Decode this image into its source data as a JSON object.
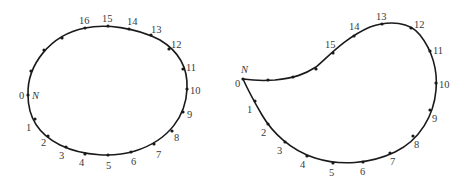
{
  "figure": {
    "left_shape": {
      "name": "ellipse",
      "start_label": "N",
      "points": [
        {
          "label": "0",
          "x": 28,
          "y": 95,
          "lx": 19,
          "ly": 99
        },
        {
          "label": "1",
          "x": 35,
          "y": 119,
          "lx": 26,
          "ly": 131
        },
        {
          "label": "2",
          "x": 48,
          "y": 136,
          "lx": 41,
          "ly": 146
        },
        {
          "label": "3",
          "x": 66,
          "y": 147,
          "lx": 59,
          "ly": 159
        },
        {
          "label": "4",
          "x": 85,
          "y": 154,
          "lx": 79,
          "ly": 166
        },
        {
          "label": "5",
          "x": 108,
          "y": 155,
          "lx": 106,
          "ly": 169
        },
        {
          "label": "6",
          "x": 131,
          "y": 152,
          "lx": 131,
          "ly": 165
        },
        {
          "label": "7",
          "x": 154,
          "y": 144,
          "lx": 156,
          "ly": 158
        },
        {
          "label": "8",
          "x": 172,
          "y": 131,
          "lx": 174,
          "ly": 141
        },
        {
          "label": "9",
          "x": 183,
          "y": 112,
          "lx": 187,
          "ly": 118
        },
        {
          "label": "10",
          "x": 187,
          "y": 89,
          "lx": 190,
          "ly": 94
        },
        {
          "label": "11",
          "x": 183,
          "y": 69,
          "lx": 186,
          "ly": 71
        },
        {
          "label": "12",
          "x": 169,
          "y": 49,
          "lx": 171,
          "ly": 48
        },
        {
          "label": "13",
          "x": 151,
          "y": 35,
          "lx": 151,
          "ly": 33
        },
        {
          "label": "14",
          "x": 129,
          "y": 29,
          "lx": 127,
          "ly": 25
        },
        {
          "label": "15",
          "x": 108,
          "y": 26,
          "lx": 102,
          "ly": 22
        },
        {
          "label": "16",
          "x": 85,
          "y": 28,
          "lx": 79,
          "ly": 24
        }
      ],
      "extra_points": [
        {
          "x": 62,
          "y": 38
        },
        {
          "x": 44,
          "y": 50
        },
        {
          "x": 31,
          "y": 71
        }
      ]
    },
    "right_shape": {
      "name": "cam-profile",
      "start_label": "N",
      "points": [
        {
          "label": "0",
          "x": 243,
          "y": 79,
          "lx": 235,
          "ly": 87
        },
        {
          "label": "1",
          "x": 255,
          "y": 101,
          "lx": 247,
          "ly": 113
        },
        {
          "label": "2",
          "x": 268,
          "y": 124,
          "lx": 261,
          "ly": 136
        },
        {
          "label": "3",
          "x": 285,
          "y": 142,
          "lx": 277,
          "ly": 154
        },
        {
          "label": "4",
          "x": 307,
          "y": 156,
          "lx": 300,
          "ly": 168
        },
        {
          "label": "5",
          "x": 333,
          "y": 163,
          "lx": 329,
          "ly": 176
        },
        {
          "label": "6",
          "x": 363,
          "y": 162,
          "lx": 360,
          "ly": 175
        },
        {
          "label": "7",
          "x": 390,
          "y": 153,
          "lx": 390,
          "ly": 165
        },
        {
          "label": "8",
          "x": 413,
          "y": 136,
          "lx": 414,
          "ly": 148
        },
        {
          "label": "9",
          "x": 430,
          "y": 110,
          "lx": 432,
          "ly": 122
        },
        {
          "label": "10",
          "x": 436,
          "y": 83,
          "lx": 439,
          "ly": 88
        },
        {
          "label": "11",
          "x": 430,
          "y": 51,
          "lx": 433,
          "ly": 54
        },
        {
          "label": "12",
          "x": 411,
          "y": 28,
          "lx": 414,
          "ly": 28
        },
        {
          "label": "13",
          "x": 382,
          "y": 24,
          "lx": 376,
          "ly": 20
        },
        {
          "label": "14",
          "x": 354,
          "y": 36,
          "lx": 349,
          "ly": 30
        },
        {
          "label": "15",
          "x": 333,
          "y": 53,
          "lx": 325,
          "ly": 48
        }
      ],
      "extra_points": [
        {
          "x": 316,
          "y": 69
        },
        {
          "x": 293,
          "y": 77
        },
        {
          "x": 268,
          "y": 80
        }
      ]
    },
    "colors": {
      "curve": "#1a1a1a",
      "label": "#3a3a3a",
      "background": "#ffffff"
    }
  }
}
